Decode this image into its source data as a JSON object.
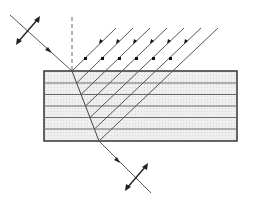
{
  "diagram": {
    "colors": {
      "line": "#444444",
      "slab_fill": "#ececec",
      "slab_border": "#333333",
      "layer_line": "#666666",
      "arrow": "#222222"
    },
    "slab": {
      "x": 44,
      "y": 71,
      "width": 193,
      "height": 70,
      "layer_lines_y": [
        83,
        94,
        106,
        117,
        129
      ]
    },
    "incident_ray": {
      "from": [
        10,
        15
      ],
      "to": [
        72,
        71
      ],
      "arrow_at": [
        49,
        50
      ],
      "polarization_arrow_center": [
        28,
        31
      ]
    },
    "normal": {
      "x": 72,
      "y1": 17,
      "y2": 71,
      "style": "dashed"
    },
    "refracted_ray": {
      "from": [
        72,
        71
      ],
      "to": [
        99,
        141
      ]
    },
    "exit_ray": {
      "from": [
        99,
        141
      ],
      "to": [
        151,
        193
      ],
      "arrow_at": [
        118,
        161
      ],
      "polarization_arrow_center": [
        136,
        178
      ]
    },
    "reflected_rays": {
      "count": 7,
      "top_y": 28,
      "arrow_markers_y": 42,
      "dot_markers_y": 58,
      "arrow_x": [
        101,
        118,
        135,
        152,
        169,
        186
      ],
      "dot_x": [
        85,
        102,
        119,
        136,
        153,
        170
      ]
    }
  }
}
